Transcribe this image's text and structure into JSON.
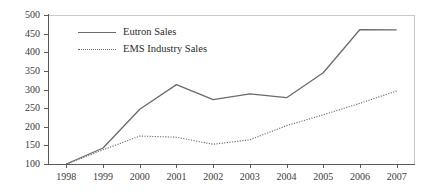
{
  "chart_data": {
    "type": "line",
    "title": "",
    "subtitle": "",
    "xlabel": "",
    "ylabel": "",
    "categories": [
      "1998",
      "1999",
      "2000",
      "2001",
      "2002",
      "2003",
      "2004",
      "2005",
      "2006",
      "2007"
    ],
    "x": [
      1998,
      1999,
      2000,
      2001,
      2002,
      2003,
      2004,
      2005,
      2006,
      2007
    ],
    "ylim": [
      100,
      500
    ],
    "yticks": [
      100,
      150,
      200,
      250,
      300,
      350,
      400,
      450,
      500
    ],
    "grid": false,
    "legend_position": "upper-left-inside",
    "series": [
      {
        "name": "Eutron Sales",
        "style": "solid",
        "color": "#6b6b6b",
        "values": [
          100,
          143,
          247,
          313,
          273,
          288,
          278,
          345,
          461,
          460
        ]
      },
      {
        "name": "EMS Industry Sales",
        "style": "dotted",
        "color": "#6b6b6b",
        "values": [
          100,
          138,
          175,
          172,
          153,
          165,
          203,
          232,
          263,
          296
        ]
      }
    ]
  },
  "axes": {
    "y_tick_labels": [
      "500",
      "450",
      "400",
      "350",
      "300",
      "250",
      "200",
      "150",
      "100"
    ],
    "x_tick_labels": [
      "1998",
      "1999",
      "2000",
      "2001",
      "2002",
      "2003",
      "2004",
      "2005",
      "2006",
      "2007"
    ]
  },
  "legend": {
    "items": [
      {
        "label": "Eutron Sales",
        "style": "solid"
      },
      {
        "label": "EMS Industry Sales",
        "style": "dotted"
      }
    ]
  },
  "colors": {
    "series_line": "#6b6b6b",
    "axis": "#5a5a5a",
    "frame": "#c9c9c9",
    "text": "#3a3a3a",
    "background": "#ffffff"
  }
}
